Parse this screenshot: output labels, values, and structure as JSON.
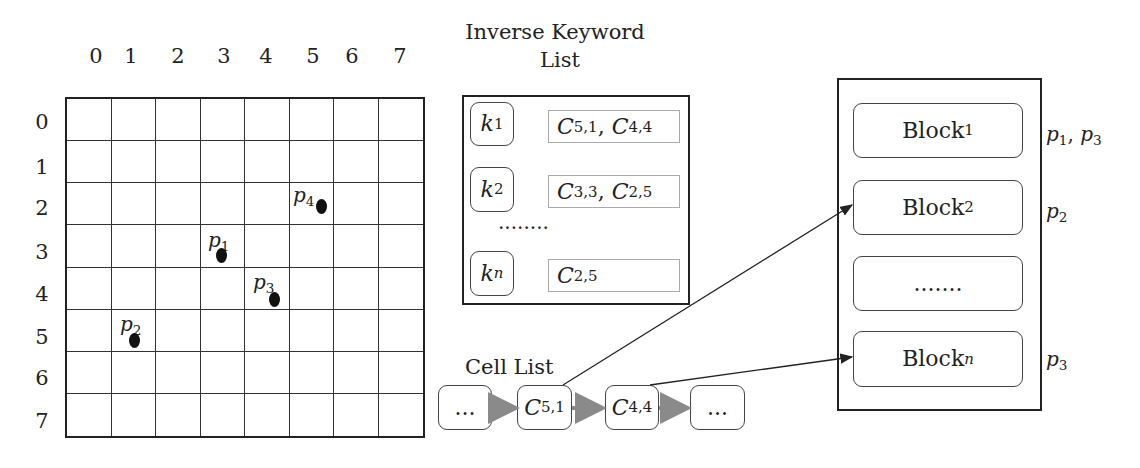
{
  "grid": {
    "col_ticks": [
      "0",
      "1",
      "2",
      "3",
      "4",
      "5",
      "6",
      "7"
    ],
    "row_ticks": [
      "0",
      "1",
      "2",
      "3",
      "4",
      "5",
      "6",
      "7"
    ],
    "points": [
      {
        "label": "p",
        "sub": "4",
        "col": 5,
        "row": 2
      },
      {
        "label": "p",
        "sub": "1",
        "col": 3,
        "row": 3
      },
      {
        "label": "p",
        "sub": "3",
        "col": 4,
        "row": 4
      },
      {
        "label": "p",
        "sub": "2",
        "col": 1,
        "row": 5
      }
    ]
  },
  "inverse_keyword_list": {
    "title_line1": "Inverse Keyword",
    "title_line2": "List",
    "entries": [
      {
        "key": "k",
        "key_sub": "1",
        "cells": [
          {
            "c": "C",
            "s": "5,1"
          },
          {
            "c": "C",
            "s": "4,4"
          }
        ]
      },
      {
        "key": "k",
        "key_sub": "2",
        "cells": [
          {
            "c": "C",
            "s": "3,3"
          },
          {
            "c": "C",
            "s": "2,5"
          }
        ]
      },
      {
        "key": "k",
        "key_sub": "n",
        "cells": [
          {
            "c": "C",
            "s": "2,5"
          }
        ]
      }
    ],
    "ellipsis": "........"
  },
  "cell_list": {
    "title": "Cell List",
    "nodes": [
      {
        "text": "...",
        "sub": ""
      },
      {
        "text": "C",
        "sub": "5,1"
      },
      {
        "text": "C",
        "sub": "4,4"
      },
      {
        "text": "...",
        "sub": ""
      }
    ]
  },
  "blocks": {
    "items": [
      {
        "text": "Block",
        "sub": "1",
        "points": "p1, p3"
      },
      {
        "text": "Block",
        "sub": "2",
        "points": "p2"
      },
      {
        "text": ".......",
        "sub": "",
        "points": ""
      },
      {
        "text": "Block",
        "sub": "n",
        "points": "p3"
      }
    ],
    "point_labels": [
      {
        "parts": [
          {
            "p": "p",
            "s": "1"
          },
          {
            "p": "p",
            "s": "3"
          }
        ]
      },
      {
        "parts": [
          {
            "p": "p",
            "s": "2"
          }
        ]
      },
      {
        "parts": []
      },
      {
        "parts": [
          {
            "p": "p",
            "s": "3"
          }
        ]
      }
    ]
  },
  "colors": {
    "line": "#222222",
    "arrow_gray": "#8a8a8a",
    "entry_border": "#aaaaaa"
  }
}
